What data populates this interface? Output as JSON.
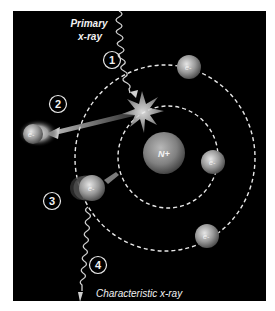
{
  "diagram": {
    "labels": {
      "primary_line1": "Primary",
      "primary_line2": "x-ray",
      "characteristic": "Characteristic x-ray",
      "nucleus": "N+",
      "electron": "e-"
    },
    "steps": [
      "1",
      "2",
      "3",
      "4"
    ],
    "colors": {
      "background": "#000000",
      "frame": "#ffffff",
      "sphere_light": "#d8d8d8",
      "sphere_dark": "#5a5a5a",
      "orbit": "#e8e8e8",
      "text": "#f2f2f2"
    },
    "orbits": [
      {
        "name": "inner-orbit",
        "cx": 168,
        "cy": 157,
        "rx": 50,
        "ry": 51
      },
      {
        "name": "outer-orbit",
        "cx": 165,
        "cy": 158,
        "rx": 90,
        "ry": 93
      }
    ],
    "electrons": [
      {
        "name": "electron-top-right",
        "cx": 189,
        "cy": 67,
        "r": 12
      },
      {
        "name": "electron-inner-right",
        "cx": 213,
        "cy": 162,
        "r": 12
      },
      {
        "name": "electron-bottom-right",
        "cx": 207,
        "cy": 236,
        "r": 12
      },
      {
        "name": "electron-transition",
        "cx": 92,
        "cy": 188,
        "r": 13
      },
      {
        "name": "electron-ejected",
        "cx": 33,
        "cy": 134,
        "r": 12
      }
    ],
    "nucleus": {
      "cx": 164,
      "cy": 153,
      "r": 21
    }
  }
}
